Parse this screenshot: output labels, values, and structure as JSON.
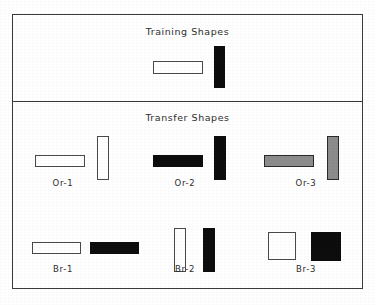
{
  "figure": {
    "background_color": "#ffffff",
    "frame_color": "#3a3a3a",
    "outline_fill": "#ffffff",
    "solid_fill": "#0d0d0d",
    "gray_fill": "#8c8c8c"
  },
  "panels": [
    {
      "id": "training",
      "title": "Training Shapes",
      "shapes": [
        {
          "name": "training-horizontal-white-bar",
          "fill": "outline",
          "left": 153,
          "top": 61,
          "width": 50,
          "height": 13
        },
        {
          "name": "training-vertical-black-bar",
          "fill": "solid",
          "left": 214,
          "top": 46,
          "width": 11,
          "height": 42
        }
      ]
    },
    {
      "id": "transfer",
      "title": "Transfer Shapes",
      "groups": [
        {
          "label": "Or-1",
          "label_left": 33,
          "label_top": 178,
          "label_width": 60,
          "shapes": [
            {
              "name": "or1-horizontal-white-bar",
              "fill": "outline",
              "left": 35,
              "top": 155,
              "width": 50,
              "height": 12
            },
            {
              "name": "or1-vertical-white-bar",
              "fill": "outline",
              "left": 97,
              "top": 136,
              "width": 12,
              "height": 44
            }
          ]
        },
        {
          "label": "Or-2",
          "label_left": 155,
          "label_top": 178,
          "label_width": 60,
          "shapes": [
            {
              "name": "or2-horizontal-black-bar",
              "fill": "solid",
              "left": 153,
              "top": 155,
              "width": 50,
              "height": 12
            },
            {
              "name": "or2-vertical-black-bar",
              "fill": "solid",
              "left": 214,
              "top": 136,
              "width": 12,
              "height": 44
            }
          ]
        },
        {
          "label": "Or-3",
          "label_left": 276,
          "label_top": 178,
          "label_width": 60,
          "shapes": [
            {
              "name": "or3-horizontal-gray-bar",
              "fill": "gray",
              "left": 264,
              "top": 155,
              "width": 50,
              "height": 12
            },
            {
              "name": "or3-vertical-gray-bar",
              "fill": "gray",
              "left": 327,
              "top": 136,
              "width": 12,
              "height": 44
            }
          ]
        },
        {
          "label": "Br-1",
          "label_left": 33,
          "label_top": 264,
          "label_width": 60,
          "shapes": [
            {
              "name": "br1-horizontal-white-bar",
              "fill": "outline",
              "left": 32,
              "top": 242,
              "width": 49,
              "height": 12
            },
            {
              "name": "br1-horizontal-black-bar",
              "fill": "solid",
              "left": 90,
              "top": 242,
              "width": 49,
              "height": 12
            }
          ]
        },
        {
          "label": "Br-2",
          "label_left": 155,
          "label_top": 264,
          "label_width": 60,
          "shapes": [
            {
              "name": "br2-vertical-white-bar",
              "fill": "outline",
              "left": 174,
              "top": 228,
              "width": 12,
              "height": 44
            },
            {
              "name": "br2-vertical-black-bar",
              "fill": "solid",
              "left": 203,
              "top": 228,
              "width": 12,
              "height": 44
            }
          ]
        },
        {
          "label": "Br-3",
          "label_left": 276,
          "label_top": 264,
          "label_width": 60,
          "shapes": [
            {
              "name": "br3-white-square",
              "fill": "outline",
              "left": 268,
              "top": 232,
              "width": 28,
              "height": 28
            },
            {
              "name": "br3-black-square",
              "fill": "solid",
              "left": 311,
              "top": 232,
              "width": 30,
              "height": 29
            }
          ]
        }
      ]
    }
  ]
}
